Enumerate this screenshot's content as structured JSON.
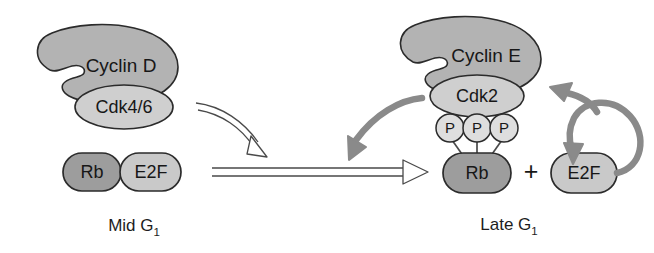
{
  "figure": {
    "background": "#ffffff"
  },
  "colors": {
    "cyclin_fill": "#b3b3b3",
    "cdk_fill": "#cfcfcf",
    "rb_fill": "#9d9d9d",
    "e2f_fill": "#c9c9c9",
    "phosphate_fill": "#dedede",
    "outline": "#2b2b2b",
    "gray_arrow": "#8a8a8a",
    "hollow_arrow_stroke": "#4a4a4a",
    "hollow_arrow_fill": "#ffffff",
    "text": "#171717"
  },
  "panels": {
    "left": {
      "stage_label": "Mid G",
      "stage_subscript": "1",
      "cyclin": {
        "label": "Cyclin D"
      },
      "cdk": {
        "label": "Cdk4/6"
      },
      "rb": {
        "label": "Rb"
      },
      "e2f": {
        "label": "E2F"
      }
    },
    "right": {
      "stage_label": "Late G",
      "stage_subscript": "1",
      "cyclin": {
        "label": "Cyclin E"
      },
      "cdk": {
        "label": "Cdk2"
      },
      "rb": {
        "label": "Rb"
      },
      "e2f": {
        "label": "E2F"
      },
      "plus_sign": "+",
      "phosphates": [
        {
          "label": "P"
        },
        {
          "label": "P"
        },
        {
          "label": "P"
        }
      ]
    }
  },
  "arrows": {
    "cyclind_to_rb": {
      "style": "hollow-curved",
      "direction": "down-right"
    },
    "mid_to_late": {
      "style": "hollow-straight",
      "direction": "right"
    },
    "cyclin_e_to_left": {
      "style": "solid-gray-curved",
      "direction": "down-left"
    },
    "e2f_feedback_up": {
      "style": "solid-gray-curved",
      "direction": "up-left"
    },
    "e2f_feedback_down": {
      "style": "solid-gray-curved",
      "direction": "down"
    }
  }
}
